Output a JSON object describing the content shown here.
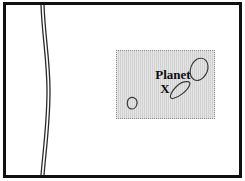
{
  "figure": {
    "caption_line_1": "Planet",
    "caption_line_2": "X",
    "frame_color": "#111111",
    "background_color": "#ffffff",
    "inset_fill_color": "#d2d2d2",
    "inset_border_color": "#8a8a8a",
    "outline_color": "#3a3a3a"
  },
  "map": {
    "boundary_line_name": "double-meridian-curve",
    "boundary_line_color": "#2b2b2b"
  },
  "inset": {
    "landmass_1": "upper-right-landmass",
    "landmass_2": "teardrop-landmass",
    "landmass_3": "small-oval-landmass"
  }
}
